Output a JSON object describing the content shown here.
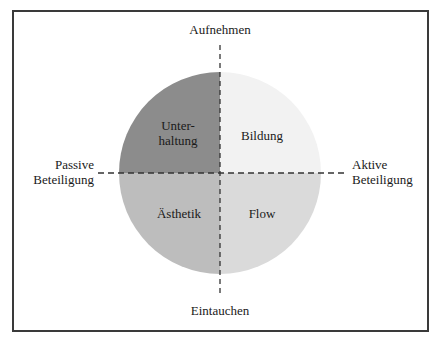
{
  "diagram": {
    "axes": {
      "top": "Aufnehmen",
      "bottom": "Eintauchen",
      "left_line1": "Passive",
      "left_line2": "Beteiligung",
      "right_line1": "Aktive",
      "right_line2": "Beteiligung"
    },
    "quadrants": {
      "top_left": {
        "line1": "Unter-",
        "line2": "haltung",
        "color": "#8c8c8c"
      },
      "top_right": {
        "label": "Bildung",
        "color": "#f2f2f2"
      },
      "bottom_left": {
        "label": "Ästhetik",
        "color": "#bdbdbd"
      },
      "bottom_right": {
        "label": "Flow",
        "color": "#dadada"
      }
    }
  }
}
